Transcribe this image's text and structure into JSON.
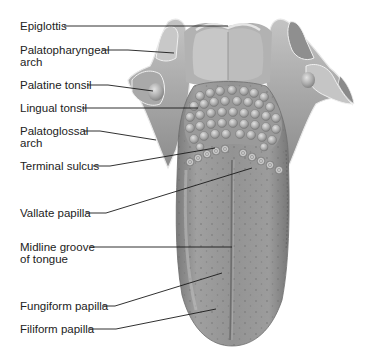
{
  "figure": {
    "colors": {
      "background": "#ffffff",
      "text": "#222222",
      "leader_line": "#1a1a1a",
      "tongue_base": "#8e8e8e",
      "tongue_light": "#b8b8b8",
      "tonsil_bump": "#c9c9c9",
      "pharynx": "#a7a7a7"
    }
  },
  "labels": [
    {
      "id": "epiglottis",
      "line1": "Epiglottis",
      "line2": "",
      "x": 20,
      "y": 20,
      "target": [
        228,
        26
      ],
      "start": [
        64,
        26
      ]
    },
    {
      "id": "palatopharyngeal-arch",
      "line1": "Palatopharyngeal",
      "line2": "arch",
      "x": 20,
      "y": 44,
      "target": [
        174,
        53
      ],
      "start": [
        102,
        50
      ]
    },
    {
      "id": "palatine-tonsil",
      "line1": "Palatine tonsil",
      "line2": "",
      "x": 20,
      "y": 79,
      "target": [
        153,
        91
      ],
      "start": [
        87,
        85
      ]
    },
    {
      "id": "lingual-tonsil",
      "line1": "Lingual tonsil",
      "line2": "",
      "x": 20,
      "y": 102,
      "target": [
        198,
        108
      ],
      "start": [
        82,
        108
      ]
    },
    {
      "id": "palatoglossal-arch",
      "line1": "Palatoglossal",
      "line2": "arch",
      "x": 20,
      "y": 126,
      "target": [
        156,
        140
      ],
      "start": [
        83,
        131
      ]
    },
    {
      "id": "terminal-sulcus",
      "line1": "Terminal sulcus",
      "line2": "",
      "x": 20,
      "y": 160,
      "target": [
        215,
        148
      ],
      "start": [
        93,
        166
      ]
    },
    {
      "id": "vallate-papilla",
      "line1": "Vallate papilla",
      "line2": "",
      "x": 20,
      "y": 206,
      "target": [
        252,
        168
      ],
      "start": [
        86,
        213
      ]
    },
    {
      "id": "midline-groove",
      "line1": "Midline groove",
      "line2": "of tongue",
      "x": 20,
      "y": 240,
      "target": [
        232,
        247
      ],
      "start": [
        90,
        247
      ]
    },
    {
      "id": "fungiform-papilla",
      "line1": "Fungiform papilla",
      "line2": "",
      "x": 20,
      "y": 300,
      "target": [
        222,
        273
      ],
      "start": [
        102,
        306
      ]
    },
    {
      "id": "filiform-papilla",
      "line1": "Filiform papilla",
      "line2": "",
      "x": 20,
      "y": 323,
      "target": [
        216,
        309
      ],
      "start": [
        88,
        329
      ]
    }
  ]
}
